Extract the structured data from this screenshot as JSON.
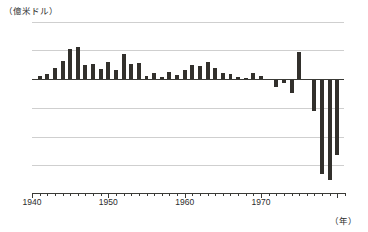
{
  "chart_data": {
    "type": "bar",
    "title": "",
    "subtitle": "",
    "unit_label": "（億米ドル）",
    "xlabel": "（年）",
    "ylabel": "",
    "ylim": [
      -400,
      200
    ],
    "yticks": [
      200,
      100,
      0,
      -100,
      -200,
      -300,
      -400
    ],
    "ytick_labels": [
      "200",
      "100",
      "0",
      "-100",
      "-200",
      "-300",
      "-400"
    ],
    "xlim": [
      1940,
      1981
    ],
    "xticks": [
      1940,
      1950,
      1960,
      1970
    ],
    "xtick_labels": [
      "1940",
      "1950",
      "1960",
      "1970"
    ],
    "grid": true,
    "grid_axis": "y",
    "legend": null,
    "bar_color": "#32302c",
    "grid_color": "#cfcfcf",
    "axis_color": "#3a3a36",
    "categories": [
      1941,
      1942,
      1943,
      1944,
      1945,
      1946,
      1947,
      1948,
      1949,
      1950,
      1951,
      1952,
      1953,
      1954,
      1955,
      1956,
      1957,
      1958,
      1959,
      1960,
      1961,
      1962,
      1963,
      1964,
      1965,
      1966,
      1967,
      1968,
      1969,
      1970,
      1971,
      1972,
      1973,
      1974,
      1975,
      1976,
      1977,
      1978,
      1979,
      1980
    ],
    "values": [
      10,
      18,
      40,
      62,
      105,
      110,
      48,
      52,
      35,
      58,
      30,
      88,
      52,
      55,
      12,
      22,
      8,
      24,
      14,
      30,
      48,
      45,
      58,
      38,
      22,
      18,
      6,
      4,
      22,
      10,
      -2,
      -28,
      -14,
      -48,
      95,
      -5,
      -110,
      -330,
      -350,
      -265
    ]
  }
}
